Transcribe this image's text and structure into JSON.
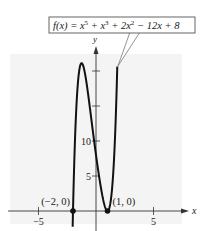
{
  "chart_data": {
    "type": "line",
    "function_label": {
      "prefix": "f(x) = x",
      "terms": [
        {
          "base": "x",
          "exp": "5"
        },
        {
          "base": "x",
          "exp": "3"
        },
        {
          "base": "2x",
          "exp": "2"
        }
      ],
      "text_parts": [
        "f(x) = x",
        "5",
        " + x",
        "3",
        " + 2x",
        "2",
        " − 12x + 8"
      ]
    },
    "xlabel": "x",
    "ylabel": "y",
    "x_ticks": [
      {
        "value": -5,
        "label": "−5"
      },
      {
        "value": 5,
        "label": "5"
      }
    ],
    "y_ticks": [
      {
        "value": 5,
        "label": "5"
      },
      {
        "value": 10,
        "label": "10"
      },
      {
        "value": 15,
        "label": ""
      },
      {
        "value": 20,
        "label": ""
      }
    ],
    "xlim": [
      -7.5,
      7.7
    ],
    "ylim": [
      -3,
      23
    ],
    "grid": false,
    "coefficients": {
      "x5": 1,
      "x4": 0,
      "x3": 1,
      "x2": 2,
      "x1": -12,
      "x0": 8
    },
    "annotated_points": [
      {
        "x": -2,
        "y": 0,
        "label": "(−2, 0)"
      },
      {
        "x": 1,
        "y": 0,
        "label": "(1, 0)"
      }
    ],
    "series": [
      {
        "name": "f(x)",
        "x": [
          -2.2,
          -2.0,
          -1.8,
          -1.6,
          -1.4,
          -1.2,
          -1.0,
          -0.8,
          -0.6,
          -0.4,
          -0.2,
          0.0,
          0.2,
          0.4,
          0.6,
          0.8,
          1.0,
          1.2,
          1.4,
          1.6,
          1.7
        ],
        "values": [
          -5.4,
          0.0,
          9.3,
          16.5,
          20.4,
          21.3,
          20.0,
          17.0,
          15.0,
          13.4,
          10.5,
          8.0,
          5.7,
          3.6,
          1.9,
          0.6,
          0.0,
          0.5,
          3.0,
          8.4,
          12.8
        ]
      }
    ],
    "colors": {
      "curve": "#111111",
      "background_panel": "#f3f3f3",
      "axis": "#333333",
      "label_box_border": "#555555"
    }
  }
}
